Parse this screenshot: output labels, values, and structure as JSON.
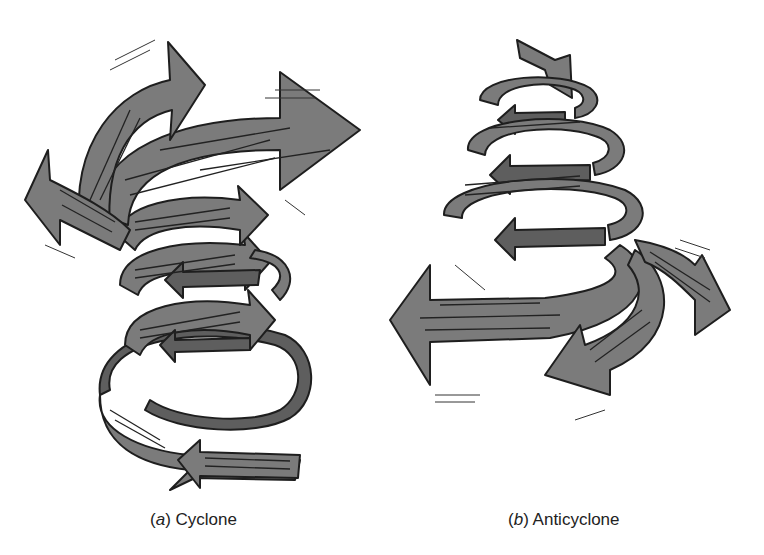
{
  "figure": {
    "panels": [
      {
        "id": "a",
        "letter": "a",
        "title": "Cyclone",
        "description": "Converging spiral airflow rising upward; ribbon arrows widen toward the top"
      },
      {
        "id": "b",
        "letter": "b",
        "title": "Anticyclone",
        "description": "Diverging spiral airflow descending; ribbon arrows widen toward the bottom"
      }
    ],
    "colors": {
      "ribbon_fill": "#7b7b7b",
      "ribbon_shadow": "#5e5e5e",
      "outline": "#1e1e1e",
      "background": "#ffffff"
    }
  }
}
